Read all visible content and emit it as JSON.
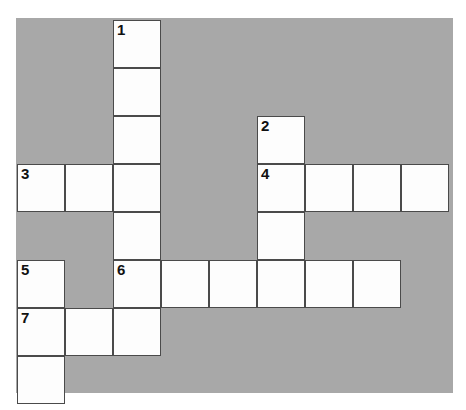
{
  "puzzle": {
    "title": "Crossword Puzzle Grid",
    "background_color": "#a8a8a8",
    "cell_fill_color": "#fdfdfd",
    "cell_border_color": "#4a4a4a",
    "page_background_color": "#ffffff",
    "grid": {
      "columns": 9,
      "rows": 8,
      "cell_size": 48,
      "origin_x": 1,
      "origin_y": 2
    },
    "cells": [
      {
        "id": "cell-r0c2",
        "row": 0,
        "col": 2,
        "number": "1",
        "letter": ""
      },
      {
        "id": "cell-r1c2",
        "row": 1,
        "col": 2,
        "number": "",
        "letter": ""
      },
      {
        "id": "cell-r2c2",
        "row": 2,
        "col": 2,
        "number": "",
        "letter": ""
      },
      {
        "id": "cell-r2c5",
        "row": 2,
        "col": 5,
        "number": "2",
        "letter": ""
      },
      {
        "id": "cell-r3c0",
        "row": 3,
        "col": 0,
        "number": "3",
        "letter": ""
      },
      {
        "id": "cell-r3c1",
        "row": 3,
        "col": 1,
        "number": "",
        "letter": ""
      },
      {
        "id": "cell-r3c2",
        "row": 3,
        "col": 2,
        "number": "",
        "letter": ""
      },
      {
        "id": "cell-r3c5",
        "row": 3,
        "col": 5,
        "number": "4",
        "letter": ""
      },
      {
        "id": "cell-r3c6",
        "row": 3,
        "col": 6,
        "number": "",
        "letter": ""
      },
      {
        "id": "cell-r3c7",
        "row": 3,
        "col": 7,
        "number": "",
        "letter": ""
      },
      {
        "id": "cell-r3c8",
        "row": 3,
        "col": 8,
        "number": "",
        "letter": ""
      },
      {
        "id": "cell-r4c2",
        "row": 4,
        "col": 2,
        "number": "",
        "letter": ""
      },
      {
        "id": "cell-r4c5",
        "row": 4,
        "col": 5,
        "number": "",
        "letter": ""
      },
      {
        "id": "cell-r5c0",
        "row": 5,
        "col": 0,
        "number": "5",
        "letter": ""
      },
      {
        "id": "cell-r5c2",
        "row": 5,
        "col": 2,
        "number": "6",
        "letter": ""
      },
      {
        "id": "cell-r5c3",
        "row": 5,
        "col": 3,
        "number": "",
        "letter": ""
      },
      {
        "id": "cell-r5c4",
        "row": 5,
        "col": 4,
        "number": "",
        "letter": ""
      },
      {
        "id": "cell-r5c5",
        "row": 5,
        "col": 5,
        "number": "",
        "letter": ""
      },
      {
        "id": "cell-r5c6",
        "row": 5,
        "col": 6,
        "number": "",
        "letter": ""
      },
      {
        "id": "cell-r5c7",
        "row": 5,
        "col": 7,
        "number": "",
        "letter": ""
      },
      {
        "id": "cell-r6c0",
        "row": 6,
        "col": 0,
        "number": "7",
        "letter": ""
      },
      {
        "id": "cell-r6c1",
        "row": 6,
        "col": 1,
        "number": "",
        "letter": ""
      },
      {
        "id": "cell-r6c2",
        "row": 6,
        "col": 2,
        "number": "",
        "letter": ""
      },
      {
        "id": "cell-r7c0",
        "row": 7,
        "col": 0,
        "number": "",
        "letter": ""
      }
    ],
    "entries": {
      "across": [
        {
          "number": "3",
          "row": 3,
          "col": 0,
          "length": 3
        },
        {
          "number": "4",
          "row": 3,
          "col": 5,
          "length": 4
        },
        {
          "number": "6",
          "row": 5,
          "col": 2,
          "length": 6
        },
        {
          "number": "7",
          "row": 6,
          "col": 0,
          "length": 3
        }
      ],
      "down": [
        {
          "number": "1",
          "row": 0,
          "col": 2,
          "length": 7
        },
        {
          "number": "2",
          "row": 2,
          "col": 5,
          "length": 3
        },
        {
          "number": "5",
          "row": 5,
          "col": 0,
          "length": 3
        }
      ]
    }
  }
}
